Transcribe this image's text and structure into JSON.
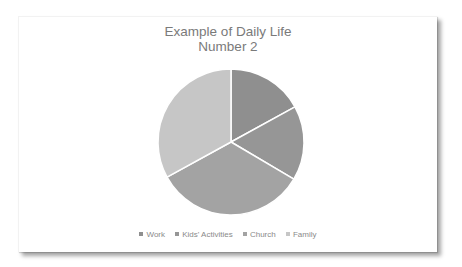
{
  "chart_data": {
    "type": "pie",
    "title": "Example of Daily Life Number 2",
    "title_lines": [
      "Example of Daily Life",
      "Number 2"
    ],
    "categories": [
      "Work",
      "Kids' Activities",
      "Church",
      "Family"
    ],
    "values": [
      17,
      16.5,
      33.5,
      33
    ],
    "colors": [
      "#8f8f8f",
      "#969696",
      "#a3a3a3",
      "#c6c6c6"
    ],
    "start_angle_deg": 0,
    "direction": "clockwise",
    "legend_position": "bottom",
    "xlabel": "",
    "ylabel": ""
  },
  "legend": {
    "items": [
      {
        "label": "Work",
        "color": "#8f8f8f"
      },
      {
        "label": "Kids' Activities",
        "color": "#969696"
      },
      {
        "label": "Church",
        "color": "#a3a3a3"
      },
      {
        "label": "Family",
        "color": "#c6c6c6"
      }
    ]
  }
}
